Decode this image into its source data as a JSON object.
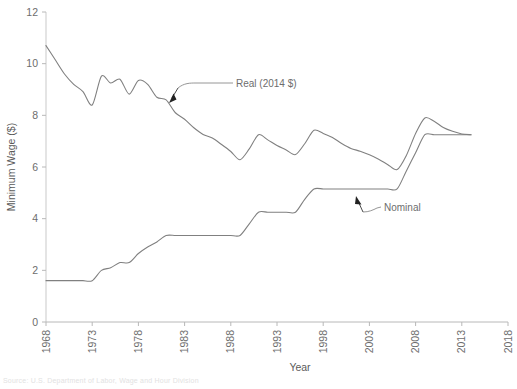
{
  "chart_data": {
    "type": "line",
    "title": "",
    "xlabel": "Year",
    "ylabel": "Minimum Wage ($)",
    "xlim": [
      1968,
      2018
    ],
    "ylim": [
      0,
      12
    ],
    "xticks": [
      1968,
      1973,
      1978,
      1983,
      1988,
      1993,
      1998,
      2003,
      2008,
      2013,
      2018
    ],
    "yticks": [
      0,
      2,
      4,
      6,
      8,
      10,
      12
    ],
    "grid": false,
    "legend_position": "inline-annotations",
    "line_color": "#808080",
    "annotations": [
      {
        "label": "Real (2014 $)",
        "series": "Real (2014 $)",
        "x": 1983.0,
        "y": 8.6
      },
      {
        "label": "Nominal",
        "series": "Nominal",
        "x": 2001.5,
        "y": 4.35
      }
    ],
    "series": [
      {
        "name": "Real (2014 $)",
        "x": [
          1968,
          1969,
          1970,
          1971,
          1972,
          1973,
          1974,
          1975,
          1976,
          1977,
          1978,
          1979,
          1980,
          1981,
          1982,
          1983,
          1984,
          1985,
          1986,
          1987,
          1988,
          1989,
          1990,
          1991,
          1992,
          1993,
          1994,
          1995,
          1996,
          1997,
          1998,
          1999,
          2000,
          2001,
          2002,
          2003,
          2004,
          2005,
          2006,
          2007,
          2008,
          2009,
          2010,
          2011,
          2012,
          2013,
          2014
        ],
        "values": [
          10.7,
          10.15,
          9.6,
          9.2,
          8.92,
          8.4,
          9.52,
          9.25,
          9.4,
          8.82,
          9.35,
          9.2,
          8.7,
          8.6,
          8.1,
          7.85,
          7.52,
          7.26,
          7.12,
          6.87,
          6.6,
          6.28,
          6.7,
          7.25,
          7.05,
          6.83,
          6.66,
          6.48,
          6.9,
          7.42,
          7.3,
          7.14,
          6.91,
          6.72,
          6.61,
          6.47,
          6.3,
          6.09,
          5.9,
          6.45,
          7.3,
          7.9,
          7.77,
          7.53,
          7.38,
          7.28,
          7.25
        ]
      },
      {
        "name": "Nominal",
        "x": [
          1968,
          1969,
          1970,
          1971,
          1972,
          1973,
          1974,
          1975,
          1976,
          1977,
          1978,
          1979,
          1980,
          1981,
          1982,
          1983,
          1984,
          1985,
          1986,
          1987,
          1988,
          1989,
          1990,
          1991,
          1992,
          1993,
          1994,
          1995,
          1996,
          1997,
          1998,
          1999,
          2000,
          2001,
          2002,
          2003,
          2004,
          2005,
          2006,
          2007,
          2008,
          2009,
          2010,
          2011,
          2012,
          2013,
          2014
        ],
        "values": [
          1.6,
          1.6,
          1.6,
          1.6,
          1.6,
          1.6,
          2.0,
          2.1,
          2.3,
          2.3,
          2.65,
          2.9,
          3.1,
          3.35,
          3.35,
          3.35,
          3.35,
          3.35,
          3.35,
          3.35,
          3.35,
          3.35,
          3.8,
          4.25,
          4.25,
          4.25,
          4.25,
          4.25,
          4.75,
          5.15,
          5.15,
          5.15,
          5.15,
          5.15,
          5.15,
          5.15,
          5.15,
          5.15,
          5.15,
          5.85,
          6.55,
          7.25,
          7.25,
          7.25,
          7.25,
          7.25,
          7.25
        ]
      }
    ]
  },
  "footnote": {
    "text": "Source: U.S. Department of Labor, Wage and Hour Division"
  }
}
